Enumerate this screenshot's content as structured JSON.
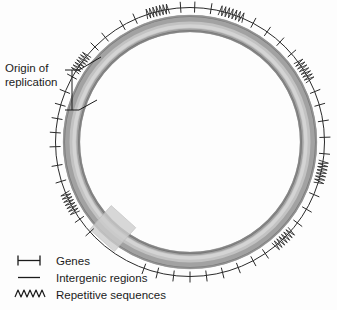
{
  "figure": {
    "background_color": "#fdfdfd",
    "ring_color_dark": "#6e6e6e",
    "ring_color_light": "#c9c9c9",
    "line_color": "#1b1b1b",
    "origin_box_color": "#cfcfcf"
  },
  "annotations": {
    "origin_label": "Origin of\nreplication",
    "origin_bracket_name": "origin-of-replication-bracket"
  },
  "legend": {
    "items": [
      {
        "symbol": "gene-barbell-icon",
        "label": "Genes"
      },
      {
        "symbol": "intergenic-line-icon",
        "label": "Intergenic regions"
      },
      {
        "symbol": "repetitive-zigzag-icon",
        "label": "Repetitive sequences"
      }
    ]
  },
  "chart_data": {
    "type": "circular-genome-map",
    "center": [
      190,
      142
    ],
    "ring_outer_radius": 127,
    "ring_inner_radius": 110,
    "annotation_circle_radius": 135,
    "origin_of_replication_angle_deg": 212,
    "features": [
      {
        "type": "tick",
        "angle_deg": 268
      },
      {
        "type": "tick",
        "angle_deg": 274
      },
      {
        "type": "tick",
        "angle_deg": 280
      },
      {
        "type": "tick",
        "angle_deg": 286
      },
      {
        "type": "tick",
        "angle_deg": 292
      },
      {
        "type": "tick",
        "angle_deg": 299
      },
      {
        "type": "squiggle",
        "angle_deg": 306,
        "span_deg": 9
      },
      {
        "type": "tick",
        "angle_deg": 315
      },
      {
        "type": "tick",
        "angle_deg": 321
      },
      {
        "type": "tick",
        "angle_deg": 330
      },
      {
        "type": "tick",
        "angle_deg": 336
      },
      {
        "type": "squiggle",
        "angle_deg": 346,
        "span_deg": 10
      },
      {
        "type": "tick",
        "angle_deg": 356
      },
      {
        "type": "tick",
        "angle_deg": 2
      },
      {
        "type": "tick",
        "angle_deg": 9
      },
      {
        "type": "squiggle",
        "angle_deg": 18,
        "span_deg": 11
      },
      {
        "type": "tick",
        "angle_deg": 28
      },
      {
        "type": "tick",
        "angle_deg": 35
      },
      {
        "type": "tick",
        "angle_deg": 42
      },
      {
        "type": "tick",
        "angle_deg": 49
      },
      {
        "type": "squiggle",
        "angle_deg": 58,
        "span_deg": 10
      },
      {
        "type": "tick",
        "angle_deg": 68
      },
      {
        "type": "tick",
        "angle_deg": 74
      },
      {
        "type": "tick",
        "angle_deg": 81
      },
      {
        "type": "tick",
        "angle_deg": 88
      },
      {
        "type": "tick",
        "angle_deg": 95
      },
      {
        "type": "squiggle",
        "angle_deg": 103,
        "span_deg": 10
      },
      {
        "type": "tick",
        "angle_deg": 113
      },
      {
        "type": "tick",
        "angle_deg": 120
      },
      {
        "type": "tick",
        "angle_deg": 127
      },
      {
        "type": "squiggle",
        "angle_deg": 136,
        "span_deg": 10
      },
      {
        "type": "tick",
        "angle_deg": 146
      },
      {
        "type": "tick",
        "angle_deg": 152
      },
      {
        "type": "tick",
        "angle_deg": 159
      },
      {
        "type": "tick",
        "angle_deg": 166
      },
      {
        "type": "tick",
        "angle_deg": 173
      },
      {
        "type": "tick",
        "angle_deg": 180
      },
      {
        "type": "tick",
        "angle_deg": 187
      },
      {
        "type": "tick",
        "angle_deg": 194
      },
      {
        "type": "tick",
        "angle_deg": 200
      },
      {
        "type": "tick",
        "angle_deg": 228
      },
      {
        "type": "tick",
        "angle_deg": 235
      },
      {
        "type": "squiggle",
        "angle_deg": 243,
        "span_deg": 10
      },
      {
        "type": "tick",
        "angle_deg": 253
      },
      {
        "type": "tick",
        "angle_deg": 260
      }
    ]
  }
}
